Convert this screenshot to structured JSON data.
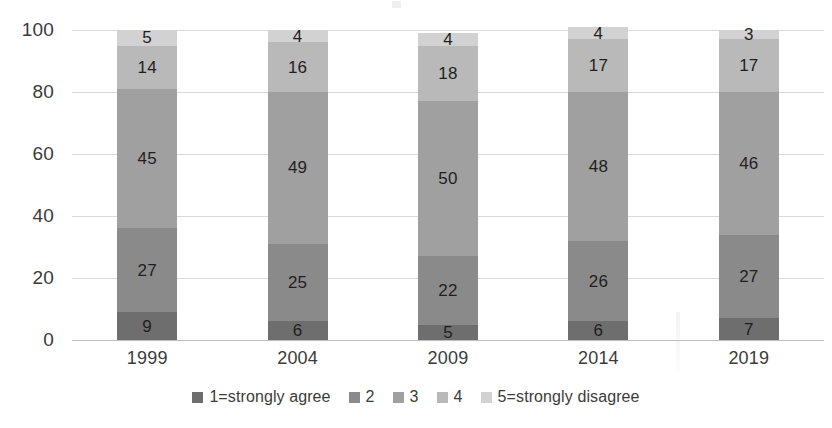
{
  "chart_data": {
    "type": "bar",
    "subtype": "100% stacked bar",
    "title": "",
    "xlabel": "",
    "ylabel": "",
    "ylim": [
      0,
      100
    ],
    "yticks": [
      0,
      20,
      40,
      60,
      80,
      100
    ],
    "ytick_labels": [
      "0",
      "20",
      "40",
      "60",
      "80",
      "100"
    ],
    "grid": true,
    "grid_axis": "y",
    "legend_position": "bottom",
    "categories": [
      "1999",
      "2004",
      "2009",
      "2014",
      "2019"
    ],
    "series": [
      {
        "name": "1=strongly agree",
        "color": "#6e6e6e",
        "values": [
          9,
          6,
          5,
          6,
          7
        ]
      },
      {
        "name": "2",
        "color": "#8a8a8a",
        "values": [
          27,
          25,
          22,
          26,
          27
        ]
      },
      {
        "name": "3",
        "color": "#a0a0a0",
        "values": [
          45,
          49,
          50,
          48,
          46
        ]
      },
      {
        "name": "4",
        "color": "#b9b9b9",
        "values": [
          14,
          16,
          18,
          17,
          17
        ]
      },
      {
        "name": "5=strongly disagree",
        "color": "#d2d2d2",
        "values": [
          5,
          4,
          4,
          4,
          3
        ]
      }
    ]
  },
  "legend": {
    "items": [
      {
        "label": "1=strongly agree",
        "color": "#6e6e6e"
      },
      {
        "label": "2",
        "color": "#8a8a8a"
      },
      {
        "label": "3",
        "color": "#a0a0a0"
      },
      {
        "label": "4",
        "color": "#b9b9b9"
      },
      {
        "label": "5=strongly disagree",
        "color": "#d2d2d2"
      }
    ]
  },
  "colors": {
    "background": "#ffffff",
    "gridline": "#d9d9d9",
    "axis_line": "#bfbfbf",
    "tick_text": "#3b3b3b",
    "data_label_text": "#1f1f1f"
  }
}
